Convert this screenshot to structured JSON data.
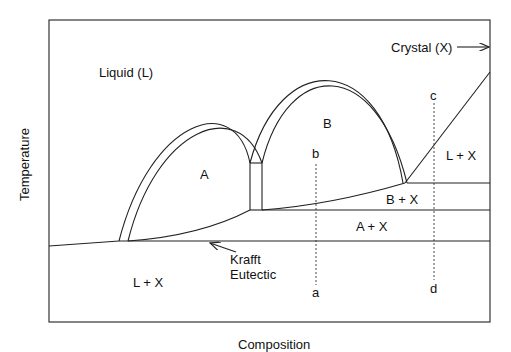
{
  "diagram": {
    "type": "phase-diagram",
    "y_axis_label": "Temperature",
    "x_axis_label": "Composition",
    "regions": {
      "liquid": "Liquid (L)",
      "crystal": "Crystal (X)",
      "phase_a": "A",
      "phase_b": "B",
      "l_plus_x_right": "L + X",
      "b_plus_x": "B + X",
      "a_plus_x": "A + X",
      "l_plus_x_bottom": "L + X"
    },
    "annotations": {
      "krafft_line1": "Krafft",
      "krafft_line2": "Eutectic"
    },
    "paths": {
      "path_top_b": "b",
      "path_bottom_a": "a",
      "path_top_c": "c",
      "path_bottom_d": "d"
    }
  }
}
